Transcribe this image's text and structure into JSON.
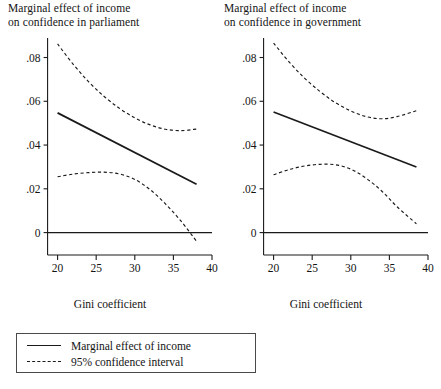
{
  "figure": {
    "background": "#ffffff",
    "line_color": "#1a1a1a"
  },
  "legend": {
    "items": [
      {
        "label": "Marginal effect of income",
        "style": "solid"
      },
      {
        "label": "95% confidence interval",
        "style": "dashed"
      }
    ]
  },
  "chart_data": [
    {
      "type": "line",
      "panel": "left",
      "title": "Marginal effect of income\non confidence in parliament",
      "xlabel": "Gini coefficient",
      "ylabel": "",
      "xlim": [
        18.5,
        40
      ],
      "ylim": [
        -0.0075,
        0.088
      ],
      "xticks": [
        20,
        25,
        30,
        35,
        40
      ],
      "xticklabels": [
        "20",
        "25",
        "30",
        "35",
        "40"
      ],
      "yticks": [
        0,
        0.02,
        0.04,
        0.06,
        0.08
      ],
      "yticklabels": [
        "0",
        ".02",
        ".04",
        ".06",
        ".08"
      ],
      "grid": false,
      "legend_position": "below-left",
      "zero_line": 0,
      "series": [
        {
          "name": "Marginal effect of income",
          "style": "solid",
          "x": [
            20,
            38
          ],
          "values": [
            0.0547,
            0.0221
          ]
        },
        {
          "name": "95% confidence interval upper",
          "style": "dashed",
          "x": [
            20,
            22,
            24,
            26,
            28,
            30,
            32,
            34,
            36,
            38
          ],
          "values": [
            0.0862,
            0.077,
            0.069,
            0.0623,
            0.0568,
            0.0524,
            0.0492,
            0.0472,
            0.0466,
            0.0473
          ]
        },
        {
          "name": "95% confidence interval lower",
          "style": "dashed",
          "x": [
            20,
            22,
            24,
            26,
            28,
            30,
            32,
            34,
            36,
            38
          ],
          "values": [
            0.0255,
            0.0267,
            0.0274,
            0.0276,
            0.0268,
            0.0243,
            0.0196,
            0.013,
            0.0052,
            -0.004
          ]
        }
      ]
    },
    {
      "type": "line",
      "panel": "right",
      "title": "Marginal effect of income\non confidence in government",
      "xlabel": "Gini coefficient",
      "ylabel": "",
      "xlim": [
        18.5,
        40
      ],
      "ylim": [
        -0.0075,
        0.088
      ],
      "xticks": [
        20,
        25,
        30,
        35,
        40
      ],
      "xticklabels": [
        "20",
        "25",
        "30",
        "35",
        "40"
      ],
      "yticks": [
        0,
        0.02,
        0.04,
        0.06,
        0.08
      ],
      "yticklabels": [
        "0",
        ".02",
        ".04",
        ".06",
        ".08"
      ],
      "grid": false,
      "legend_position": "below-left",
      "zero_line": 0,
      "series": [
        {
          "name": "Marginal effect of income",
          "style": "solid",
          "x": [
            20,
            38.5
          ],
          "values": [
            0.0551,
            0.03
          ]
        },
        {
          "name": "95% confidence interval upper",
          "style": "dashed",
          "x": [
            20,
            22,
            24,
            26,
            28,
            30,
            32,
            34,
            36,
            38.5
          ],
          "values": [
            0.0866,
            0.078,
            0.0706,
            0.0645,
            0.0594,
            0.0556,
            0.053,
            0.052,
            0.053,
            0.0557
          ]
        },
        {
          "name": "95% confidence interval lower",
          "style": "dashed",
          "x": [
            20,
            22,
            24,
            26,
            28,
            30,
            32,
            34,
            36,
            38.5
          ],
          "values": [
            0.0264,
            0.0288,
            0.0304,
            0.0312,
            0.031,
            0.029,
            0.0248,
            0.019,
            0.0118,
            0.004
          ]
        }
      ]
    }
  ]
}
